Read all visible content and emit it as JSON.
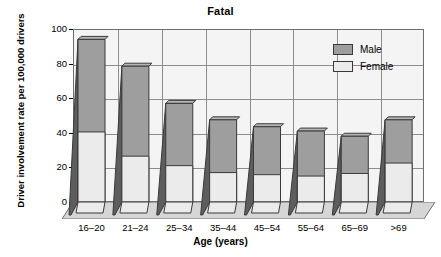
{
  "chart_data": {
    "type": "bar",
    "subtype": "stacked-3d-column",
    "title": "Fatal",
    "xlabel": "Age (years)",
    "ylabel": "Driver involvement rate per 100,000 drivers",
    "categories": [
      "16–20",
      "21–24",
      "25–34",
      "35–44",
      "45–54",
      "55–64",
      "65–69",
      ">69"
    ],
    "series": [
      {
        "name": "Female",
        "color": "#ebebeb",
        "values": [
          40.5,
          26.5,
          21.0,
          17.0,
          15.8,
          15.0,
          16.5,
          22.5
        ]
      },
      {
        "name": "Male",
        "color": "#9e9e9e",
        "values": [
          94.0,
          78.5,
          57.0,
          47.5,
          43.5,
          41.0,
          38.0,
          47.5
        ]
      }
    ],
    "stacking_note": "Male column is drawn full-height to its total; Female column is overlaid in front from 0 to its value",
    "ylim": [
      0,
      100
    ],
    "yticks": [
      0,
      20,
      40,
      60,
      80,
      100
    ],
    "ytick_labels": [
      "0",
      "20",
      "40",
      "60",
      "80",
      "100"
    ],
    "grid": true,
    "legend_position": "top-right",
    "legend": [
      "Male",
      "Female"
    ]
  },
  "axis": {
    "y_title": "Driver involvement rate per 100,000 drivers",
    "x_title": "Age (years)"
  },
  "header": {
    "title": "Fatal"
  },
  "legend": {
    "items": [
      {
        "label": "Male",
        "swatch": "male"
      },
      {
        "label": "Female",
        "swatch": "female"
      }
    ]
  },
  "colors": {
    "male": "#9e9e9e",
    "female": "#ebebeb",
    "plot_bg": "#f4f4f4",
    "grid": "#8d8d8d",
    "outline": "#3a3a3a",
    "side_face": "#5d5d5d",
    "floor": "#d6d6d6"
  }
}
